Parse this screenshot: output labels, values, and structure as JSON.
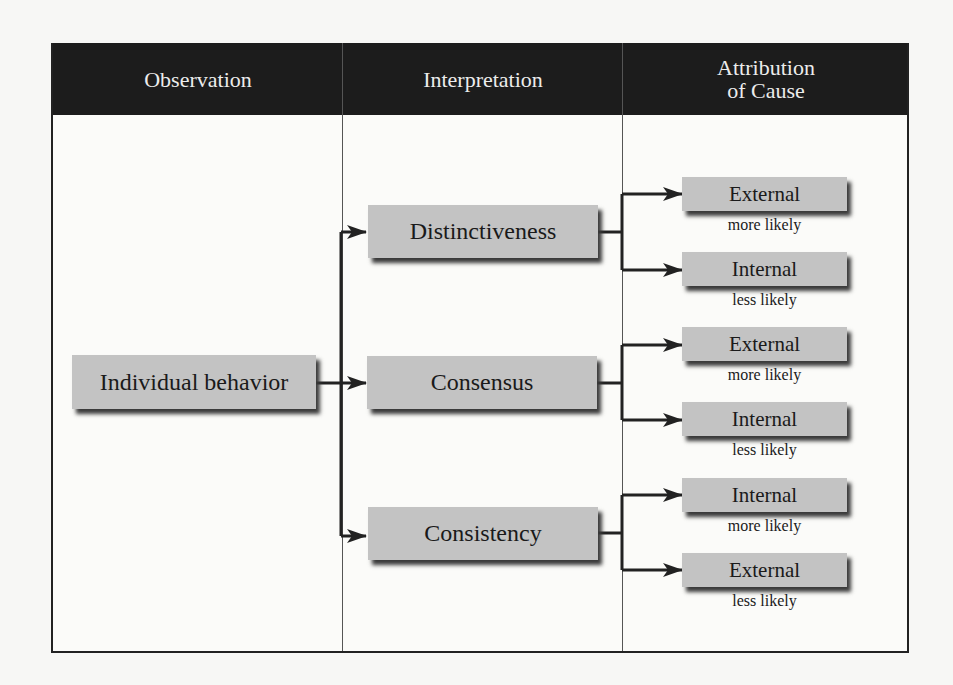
{
  "header": {
    "columns": [
      {
        "label": "Observation"
      },
      {
        "label": "Interpretation"
      },
      {
        "label_line1": "Attribution",
        "label_line2": "of Cause"
      }
    ]
  },
  "observation": {
    "label": "Individual behavior"
  },
  "interpretations": [
    {
      "label": "Distinctiveness",
      "outcomes": [
        {
          "label": "External",
          "likelihood": "more likely"
        },
        {
          "label": "Internal",
          "likelihood": "less likely"
        }
      ]
    },
    {
      "label": "Consensus",
      "outcomes": [
        {
          "label": "External",
          "likelihood": "more likely"
        },
        {
          "label": "Internal",
          "likelihood": "less likely"
        }
      ]
    },
    {
      "label": "Consistency",
      "outcomes": [
        {
          "label": "Internal",
          "likelihood": "more likely"
        },
        {
          "label": "External",
          "likelihood": "less likely"
        }
      ]
    }
  ],
  "colors": {
    "header_bg": "#1c1c1c",
    "header_text": "#ececec",
    "box_fill": "#c3c3c3",
    "line": "#222222"
  }
}
